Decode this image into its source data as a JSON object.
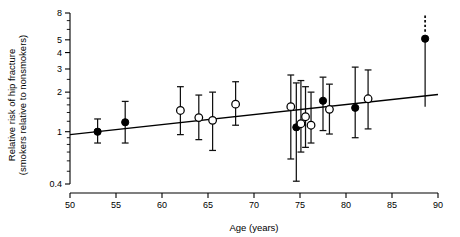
{
  "chart_data": {
    "type": "scatter",
    "title": "",
    "xlabel": "Age (years)",
    "ylabel": "Relative risk of hip fracture (smokers relative to nonsmokers)",
    "ylabel_line1": "Relative risk of hip fracture",
    "ylabel_line2": "(smokers relative to nonsmokers)",
    "xlim": [
      50,
      90
    ],
    "ylim": [
      0.4,
      8
    ],
    "yscale": "log",
    "xticks": [
      50,
      55,
      60,
      65,
      70,
      75,
      80,
      85,
      90
    ],
    "xticklabels": [
      "50",
      "55",
      "60",
      "65",
      "70",
      "75",
      "80",
      "85",
      "90"
    ],
    "yticks": [
      0.4,
      1,
      2,
      3,
      4,
      5,
      8
    ],
    "yticklabels": [
      "0.4",
      "1",
      "2",
      "3",
      "4",
      "5",
      "8"
    ],
    "yminorticks": [
      0.5,
      0.6,
      0.7,
      0.8,
      0.9,
      1.2,
      1.4,
      1.6,
      1.8,
      2.5,
      6,
      7
    ],
    "grid": false,
    "legend": "none",
    "marker_styles": {
      "filled": "filled-circle",
      "open": "open-circle"
    },
    "fit_line": {
      "label": "fitted regression line",
      "x": [
        50,
        90
      ],
      "y": [
        0.95,
        1.92
      ]
    },
    "points": [
      {
        "age": 53.0,
        "rr": 1.0,
        "lo": 0.82,
        "hi": 1.25,
        "marker": "filled"
      },
      {
        "age": 56.0,
        "rr": 1.18,
        "lo": 0.82,
        "hi": 1.7,
        "marker": "filled"
      },
      {
        "age": 62.0,
        "rr": 1.45,
        "lo": 0.95,
        "hi": 2.2,
        "marker": "open"
      },
      {
        "age": 64.0,
        "rr": 1.28,
        "lo": 0.87,
        "hi": 1.9,
        "marker": "open"
      },
      {
        "age": 65.5,
        "rr": 1.22,
        "lo": 0.72,
        "hi": 2.0,
        "marker": "open"
      },
      {
        "age": 68.0,
        "rr": 1.62,
        "lo": 1.12,
        "hi": 2.4,
        "marker": "open"
      },
      {
        "age": 74.0,
        "rr": 1.55,
        "lo": 0.62,
        "hi": 2.7,
        "marker": "open"
      },
      {
        "age": 74.6,
        "rr": 1.08,
        "lo": 0.42,
        "hi": 2.35,
        "marker": "filled"
      },
      {
        "age": 75.1,
        "rr": 1.15,
        "lo": 0.7,
        "hi": 2.45,
        "marker": "open"
      },
      {
        "age": 75.6,
        "rr": 1.3,
        "lo": 0.76,
        "hi": 2.2,
        "marker": "open"
      },
      {
        "age": 76.2,
        "rr": 1.12,
        "lo": 0.82,
        "hi": 2.0,
        "marker": "open"
      },
      {
        "age": 77.5,
        "rr": 1.72,
        "lo": 1.02,
        "hi": 2.6,
        "marker": "filled"
      },
      {
        "age": 78.2,
        "rr": 1.48,
        "lo": 0.96,
        "hi": 2.3,
        "marker": "open"
      },
      {
        "age": 81.0,
        "rr": 1.52,
        "lo": 0.9,
        "hi": 3.1,
        "marker": "filled"
      },
      {
        "age": 82.4,
        "rr": 1.78,
        "lo": 1.05,
        "hi": 2.95,
        "marker": "open"
      },
      {
        "age": 88.6,
        "rr": 5.1,
        "lo": 1.55,
        "hi": 9.5,
        "marker": "filled",
        "upper_truncated": true
      }
    ]
  }
}
